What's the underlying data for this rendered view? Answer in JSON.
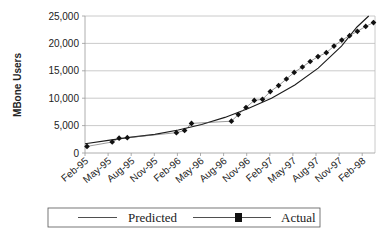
{
  "chart_data": {
    "type": "line",
    "title": "",
    "xlabel": "",
    "ylabel": "MBone Users",
    "ylim": [
      0,
      25000
    ],
    "yticks": [
      "0",
      "5,000",
      "10,000",
      "15,000",
      "20,000",
      "25,000"
    ],
    "ytick_values": [
      0,
      5000,
      10000,
      15000,
      20000,
      25000
    ],
    "grid": true,
    "legend_position": "bottom",
    "categories": [
      "Feb-95",
      "May-95",
      "Aug-95",
      "Nov-95",
      "Feb-96",
      "May-96",
      "Aug-96",
      "Nov-96",
      "Feb-97",
      "May-97",
      "Aug-97",
      "Nov-97",
      "Feb-98"
    ],
    "series": [
      {
        "name": "Predicted",
        "style": "line",
        "points": [
          {
            "m": 0,
            "v": 1700
          },
          {
            "m": 3,
            "v": 2300
          },
          {
            "m": 6,
            "v": 2900
          },
          {
            "m": 9,
            "v": 3400
          },
          {
            "m": 12,
            "v": 4200
          },
          {
            "m": 15,
            "v": 5200
          },
          {
            "m": 18,
            "v": 6500
          },
          {
            "m": 21,
            "v": 8100
          },
          {
            "m": 24,
            "v": 10000
          },
          {
            "m": 27,
            "v": 12400
          },
          {
            "m": 30,
            "v": 15500
          },
          {
            "m": 33,
            "v": 19500
          },
          {
            "m": 35,
            "v": 23000
          },
          {
            "m": 36.5,
            "v": 25000
          }
        ]
      },
      {
        "name": "Actual",
        "style": "line-marker",
        "points": [
          {
            "m": 0,
            "v": 1200
          },
          {
            "m": 5.5,
            "v": 2000
          },
          {
            "m": 7,
            "v": 2700
          },
          {
            "m": 8.8,
            "v": 2800
          },
          {
            "m": 19.5,
            "v": 3700
          },
          {
            "m": 21.3,
            "v": 4100
          },
          {
            "m": 22.8,
            "v": 5400
          },
          {
            "m": 31.5,
            "v": 5800
          },
          {
            "m": 33,
            "v": 7000
          },
          {
            "m": 34.7,
            "v": 8300
          },
          {
            "m": 36.5,
            "v": 9600
          },
          {
            "m": 38.3,
            "v": 9800
          },
          {
            "m": 40,
            "v": 11200
          },
          {
            "m": 41.8,
            "v": 12300
          },
          {
            "m": 43.5,
            "v": 13500
          },
          {
            "m": 45.2,
            "v": 14700
          },
          {
            "m": 47,
            "v": 15700
          },
          {
            "m": 48.7,
            "v": 16700
          },
          {
            "m": 50.4,
            "v": 17600
          },
          {
            "m": 52.2,
            "v": 18300
          },
          {
            "m": 53.9,
            "v": 19500
          },
          {
            "m": 55.6,
            "v": 20600
          },
          {
            "m": 57.3,
            "v": 21400
          },
          {
            "m": 59,
            "v": 22200
          },
          {
            "m": 60.8,
            "v": 23100
          },
          {
            "m": 62.5,
            "v": 23800
          }
        ]
      }
    ]
  },
  "legend": {
    "predicted_label": "Predicted",
    "actual_label": "Actual"
  }
}
